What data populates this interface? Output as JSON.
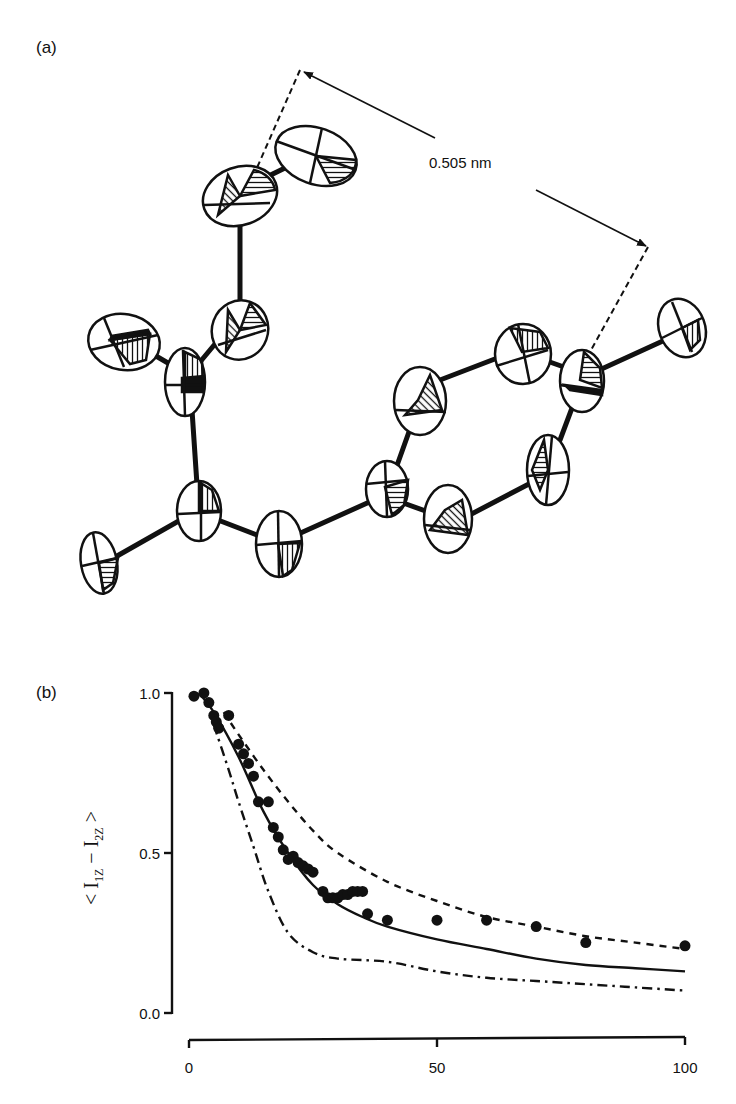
{
  "figure": {
    "panel_a": {
      "label": "(a)",
      "distance_annotation": "0.505 nm",
      "description": "ORTEP thermal-ellipsoid drawing of molecule with marked inter-atomic distance"
    },
    "panel_b": {
      "label": "(b)",
      "y_axis_label_main": "< I",
      "y_axis_label_sub1": "1Z",
      "y_axis_label_minus": " − I",
      "y_axis_label_sub2": "2Z",
      "y_axis_label_end": " >"
    }
  },
  "chart_data": {
    "type": "scatter",
    "title": "",
    "xlabel": "",
    "ylabel": "< I1Z − I2Z >",
    "xlim": [
      0,
      100
    ],
    "ylim": [
      0.0,
      1.0
    ],
    "x_ticks": [
      "0",
      "50",
      "100"
    ],
    "y_ticks": [
      "0.0",
      "0.5",
      "1.0"
    ],
    "grid": false,
    "legend": null,
    "series": [
      {
        "name": "experimental data",
        "style": "filled-circles",
        "x": [
          1,
          3,
          4,
          5,
          5.5,
          6,
          8,
          10,
          11,
          12,
          13,
          14,
          16,
          17,
          18,
          19,
          20,
          21,
          22,
          23,
          24,
          25,
          27,
          28,
          29,
          30,
          31,
          32,
          33,
          34,
          35,
          36,
          40,
          50,
          60,
          70,
          80,
          100
        ],
        "y": [
          0.99,
          1.0,
          0.97,
          0.93,
          0.91,
          0.89,
          0.93,
          0.84,
          0.81,
          0.78,
          0.74,
          0.66,
          0.66,
          0.58,
          0.55,
          0.51,
          0.48,
          0.49,
          0.47,
          0.46,
          0.45,
          0.44,
          0.38,
          0.36,
          0.36,
          0.36,
          0.37,
          0.37,
          0.38,
          0.38,
          0.38,
          0.31,
          0.29,
          0.29,
          0.29,
          0.27,
          0.22,
          0.21
        ]
      },
      {
        "name": "solid curve",
        "style": "solid",
        "x": [
          2,
          5,
          10,
          15,
          20,
          25,
          30,
          35,
          40,
          50,
          60,
          70,
          80,
          90,
          100
        ],
        "y": [
          1.0,
          0.94,
          0.8,
          0.63,
          0.5,
          0.4,
          0.34,
          0.3,
          0.27,
          0.23,
          0.2,
          0.17,
          0.15,
          0.14,
          0.13
        ]
      },
      {
        "name": "dashed curve",
        "style": "dashed",
        "x": [
          7,
          10,
          15,
          20,
          25,
          30,
          40,
          50,
          60,
          70,
          80,
          90,
          100
        ],
        "y": [
          0.94,
          0.87,
          0.76,
          0.66,
          0.57,
          0.5,
          0.41,
          0.35,
          0.3,
          0.27,
          0.24,
          0.22,
          0.2
        ]
      },
      {
        "name": "dash-dot curve",
        "style": "dash-dot",
        "x": [
          5,
          8,
          10,
          13,
          16,
          20,
          25,
          30,
          40,
          50,
          60,
          70,
          80,
          90,
          100
        ],
        "y": [
          0.9,
          0.76,
          0.66,
          0.52,
          0.38,
          0.25,
          0.19,
          0.17,
          0.16,
          0.13,
          0.11,
          0.1,
          0.09,
          0.08,
          0.07
        ]
      }
    ]
  }
}
